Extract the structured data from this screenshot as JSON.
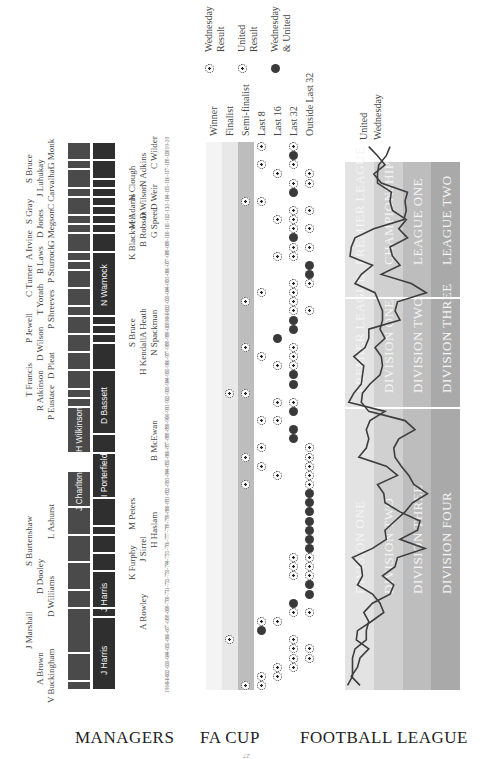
{
  "page": {
    "orientation": "rotated-90-ccw",
    "page_number": "27"
  },
  "sections": {
    "managers_title": "MANAGERS",
    "fa_cup_title": "FA CUP",
    "league_title": "FOOTBALL LEAGUE"
  },
  "colors": {
    "wednesday_bar": "#4a4a4a",
    "united_bar": "#2f2f2f",
    "winner_band": "#f4f4f4",
    "finalist_band": "#e8e8e8",
    "semi_band": "#bdbdbd",
    "league_tier1": "#e3e3e3",
    "league_tier2": "#d0d0d0",
    "league_tier3": "#bdbdbd",
    "league_tier4": "#a9a9a9",
    "line": "#3d3d3d"
  },
  "managers": {
    "wednesday": [
      {
        "name": "V Buckingham",
        "inside": false
      },
      {
        "name": "A Brown",
        "inside": false
      },
      {
        "name": "J Marshall",
        "inside": false
      },
      {
        "name": "D Williams",
        "inside": false
      },
      {
        "name": "D Dooley",
        "inside": false
      },
      {
        "name": "S Burtenshaw",
        "inside": false
      },
      {
        "name": "L Ashurst",
        "inside": false
      },
      {
        "name": "J Charlton",
        "inside": true
      },
      {
        "name": "H Wilkinson",
        "inside": true
      },
      {
        "name": "P Eustace",
        "inside": false
      },
      {
        "name": "R Atkinson",
        "inside": false
      },
      {
        "name": "T Francis",
        "inside": true
      },
      {
        "name": "D Pleat",
        "inside": false
      },
      {
        "name": "D Wilson",
        "inside": false
      },
      {
        "name": "P Jewell",
        "inside": false
      },
      {
        "name": "P Shreeves",
        "inside": false
      },
      {
        "name": "T Yorath",
        "inside": false
      },
      {
        "name": "C Turner",
        "inside": false
      },
      {
        "name": "P Sturrock",
        "inside": false
      },
      {
        "name": "B Laws",
        "inside": false
      },
      {
        "name": "A Irvine",
        "inside": false
      },
      {
        "name": "G Megson",
        "inside": false
      },
      {
        "name": "D Jones",
        "inside": false
      },
      {
        "name": "S Gray",
        "inside": false
      },
      {
        "name": "C Carvalhal",
        "inside": false
      },
      {
        "name": "J Luhukay",
        "inside": false
      },
      {
        "name": "S Bruce",
        "inside": false
      },
      {
        "name": "G Monk",
        "inside": false
      }
    ],
    "united": [
      {
        "name": "J Harris",
        "inside": true
      },
      {
        "name": "A Rowley",
        "inside": false
      },
      {
        "name": "J Harris",
        "inside": true
      },
      {
        "name": "K Furphy",
        "inside": false
      },
      {
        "name": "J Sirrel",
        "inside": false
      },
      {
        "name": "H Haslam",
        "inside": false
      },
      {
        "name": "M Peters",
        "inside": true
      },
      {
        "name": "I Porterfield",
        "inside": true
      },
      {
        "name": "B McEwan",
        "inside": false
      },
      {
        "name": "D Bassett",
        "inside": true
      },
      {
        "name": "H Kendall",
        "inside": false
      },
      {
        "name": "N Spackman",
        "inside": false
      },
      {
        "name": "S Bruce",
        "inside": false
      },
      {
        "name": "A Heath",
        "inside": false
      },
      {
        "name": "N Warnock",
        "inside": true
      },
      {
        "name": "K Blackwell",
        "inside": false
      },
      {
        "name": "B Robson",
        "inside": false
      },
      {
        "name": "G Speed",
        "inside": false
      },
      {
        "name": "M Adams",
        "inside": false
      },
      {
        "name": "D Wilson",
        "inside": false
      },
      {
        "name": "D Weir",
        "inside": false
      },
      {
        "name": "N Clough",
        "inside": false
      },
      {
        "name": "N Adkins",
        "inside": false
      },
      {
        "name": "C Wilder",
        "inside": false
      }
    ]
  },
  "fa_cup": {
    "rounds": [
      "Winner",
      "Finalist",
      "Semi-finalist",
      "Last 8",
      "Last 16",
      "Last 32",
      "Outside Last 32"
    ],
    "legend": [
      {
        "icon": "wednesday-ball-icon",
        "line1": "Wednesday",
        "line2": "Result"
      },
      {
        "icon": "united-ball-icon",
        "line1": "United",
        "line2": "Result"
      },
      {
        "icon": "both-ball-icon",
        "line1": "Wednesday",
        "line2": "& United"
      }
    ]
  },
  "league": {
    "legend": [
      "United",
      "Wednesday"
    ],
    "era1_divisions": [
      "DIVISION ONE",
      "DIVISION TWO",
      "DIVISION THREE",
      "DIVISION FOUR"
    ],
    "era2_divisions": [
      "PREMIER LEAGUE",
      "DIVISION ONE",
      "DIVISION TWO",
      "DIVISION THREE"
    ],
    "era3_divisions": [
      "PREMIER LEAGUE",
      "CHAMPIONSHIP",
      "LEAGUE ONE",
      "LEAGUE TWO"
    ]
  },
  "chart_data": [
    {
      "type": "table",
      "title": "FA CUP",
      "x": [
        "1960-61",
        "61-62",
        "62-63",
        "63-64",
        "64-65",
        "65-66",
        "66-67",
        "67-68",
        "68-69",
        "69-70",
        "70-71",
        "71-72",
        "72-73",
        "73-74",
        "74-75",
        "75-76",
        "76-77",
        "77-78",
        "78-79",
        "79-80",
        "80-81",
        "81-82",
        "82-83",
        "83-84",
        "84-85",
        "85-86",
        "86-87",
        "87-88",
        "88-89",
        "89-90",
        "90-91",
        "91-92",
        "92-93",
        "93-94",
        "94-95",
        "95-96",
        "96-97",
        "97-98",
        "98-99",
        "99-00",
        "2000-01",
        "01-02",
        "02-03",
        "03-04",
        "04-05",
        "05-06",
        "06-07",
        "07-08",
        "08-09",
        "09-10",
        "10-11",
        "11-12",
        "12-13",
        "13-14",
        "14-15",
        "15-16",
        "16-17",
        "17-18",
        "18-19",
        "2019-20"
      ],
      "categories": [
        "Winner",
        "Finalist",
        "Semi-finalist",
        "Last 8",
        "Last 16",
        "Last 32",
        "Outside Last 32"
      ],
      "series": [
        {
          "name": "Wednesday Result",
          "values": [
            "Semi-finalist",
            "Last 16",
            "Last 16",
            "Last 32",
            "Last 32",
            "Finalist",
            "Last 8",
            "Last 8",
            "Last 32",
            "Last 32",
            "Outside Last 32",
            "Outside Last 32",
            "Outside Last 32",
            "Last 32",
            "Outside Last 32",
            "Outside Last 32",
            "Outside Last 32",
            "Outside Last 32",
            "Outside Last 32",
            "Outside Last 32",
            "Outside Last 32",
            "Outside Last 32",
            "Semi-finalist",
            "Last 16",
            "Last 8",
            "Semi-finalist",
            "Last 8",
            "Last 32",
            "Last 32",
            "Last 16",
            "Last 32",
            "Last 32",
            "Finalist",
            "Last 32",
            "Last 32",
            "Last 32",
            "Last 8",
            "Last 32",
            "Last 16",
            "Last 32",
            "Last 32",
            "Last 32",
            "Last 32",
            "Last 32",
            "Outside Last 32",
            "Outside Last 32",
            "Outside Last 32",
            "Last 32",
            "Last 32",
            "Last 32",
            "Last 32",
            "Last 16",
            "Last 32",
            "Last 8",
            "Last 32",
            "Last 32",
            "Last 16",
            "Last 8",
            "Last 32",
            "Last 32"
          ]
        },
        {
          "name": "United Result",
          "values": [
            "Last 8",
            "Last 8",
            "Last 32",
            "Outside Last 32",
            "Outside Last 32",
            "Last 32",
            "Last 8",
            "Last 16",
            "Outside Last 32",
            "Last 32",
            "Outside Last 32",
            "Outside Last 32",
            "Last 32",
            "Outside Last 32",
            "Last 32",
            "Outside Last 32",
            "Outside Last 32",
            "Outside Last 32",
            "Outside Last 32",
            "Outside Last 32",
            "Outside Last 32",
            "Outside Last 32",
            "Outside Last 32",
            "Outside Last 32",
            "Outside Last 32",
            "Outside Last 32",
            "Outside Last 32",
            "Last 32",
            "Last 32",
            "Last 8",
            "Last 32",
            "Last 16",
            "Semi-finalist",
            "Last 32",
            "Last 32",
            "Last 16",
            "Last 32",
            "Semi-finalist",
            "Last 16",
            "Last 32",
            "Last 32",
            "Outside Last 32",
            "Semi-finalist",
            "Last 8",
            "Last 32",
            "Outside Last 32",
            "Outside Last 32",
            "Last 16",
            "Outside Last 32",
            "Last 32",
            "Outside Last 32",
            "Last 32",
            "Outside Last 32",
            "Semi-finalist",
            "Last 32",
            "Outside Last 32",
            "Outside Last 32",
            "Last 32",
            "Last 32",
            "Last 8"
          ]
        }
      ]
    },
    {
      "type": "line",
      "title": "FOOTBALL LEAGUE",
      "xlabel": "Season (1960-61 to 2019-20)",
      "ylabel": "League position (tiers 1-4)",
      "series": [
        {
          "name": "United",
          "values": [
            12,
            5,
            10,
            12,
            19,
            9,
            10,
            21,
            31,
            28,
            22,
            10,
            14,
            13,
            6,
            22,
            33,
            32,
            40,
            48,
            54,
            66,
            55,
            51,
            45,
            40,
            39,
            43,
            56,
            48,
            19,
            13,
            14,
            20,
            28,
            30,
            29,
            24,
            32,
            28,
            30,
            30,
            27,
            24,
            8,
            13,
            22,
            4,
            5,
            8,
            23,
            47,
            49,
            48,
            50,
            29,
            23,
            32,
            26,
            19
          ]
        },
        {
          "name": "Wednesday",
          "values": [
            2,
            6,
            6,
            6,
            8,
            17,
            17,
            19,
            15,
            22,
            36,
            39,
            30,
            40,
            42,
            64,
            44,
            58,
            60,
            44,
            32,
            31,
            26,
            42,
            33,
            11,
            17,
            19,
            17,
            20,
            32,
            3,
            7,
            13,
            14,
            15,
            7,
            16,
            19,
            19,
            44,
            40,
            42,
            65,
            53,
            29,
            44,
            38,
            36,
            50,
            43,
            49,
            38,
            36,
            37,
            26,
            26,
            27,
            33,
            36
          ]
        }
      ],
      "ylim": [
        1,
        92
      ],
      "grid": false
    }
  ]
}
